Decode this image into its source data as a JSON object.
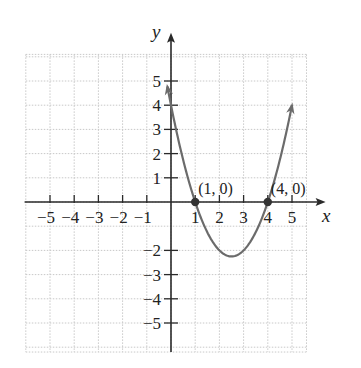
{
  "chart_data": {
    "type": "line",
    "title": "",
    "xlabel": "x",
    "ylabel": "y",
    "xlim": [
      -6,
      6
    ],
    "ylim": [
      -6,
      6
    ],
    "grid": true,
    "x_tick_labels": [
      "−5",
      "−4",
      "−3",
      "−2",
      "−1",
      "1",
      "2",
      "3",
      "4",
      "5"
    ],
    "x_ticks": [
      -5,
      -4,
      -3,
      -2,
      -1,
      1,
      2,
      3,
      4,
      5
    ],
    "y_tick_labels": [
      "5",
      "4",
      "3",
      "2",
      "1",
      "−2",
      "−3",
      "−4",
      "−5"
    ],
    "y_ticks": [
      5,
      4,
      3,
      2,
      1,
      -2,
      -3,
      -4,
      -5
    ],
    "series": [
      {
        "name": "parabola",
        "equation": "y = x^2 - 5x + 4",
        "x_range": [
          -0.15,
          5.0
        ],
        "arrows_at_ends": true,
        "vertex": [
          2.5,
          -2.25
        ],
        "color": "#6b6b6b"
      }
    ],
    "points": [
      {
        "x": 1,
        "y": 0,
        "label": "(1, 0)"
      },
      {
        "x": 4,
        "y": 0,
        "label": "(4, 0)"
      }
    ]
  },
  "colors": {
    "axis": "#2a2a2a",
    "grid": "#c8c8c8",
    "curve": "#6b6b6b",
    "point": "#333333"
  }
}
